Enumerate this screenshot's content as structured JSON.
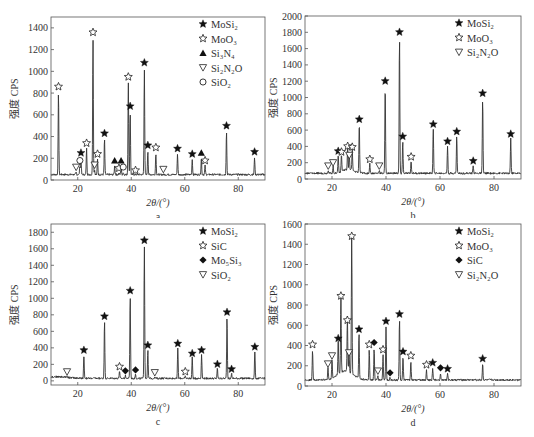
{
  "chart_data": [
    {
      "id": "a",
      "type": "line",
      "caption": "a",
      "xlabel": "2θ/(°)",
      "ylabel": "强度 CPS",
      "xlim": [
        10,
        90
      ],
      "ylim": [
        0,
        1500
      ],
      "xticks": [
        20,
        40,
        60,
        80
      ],
      "yticks": [
        0,
        200,
        400,
        600,
        800,
        1000,
        1200,
        1400
      ],
      "baseline": 50,
      "legend": [
        {
          "symbol": "star-filled",
          "label": "MoSi₂"
        },
        {
          "symbol": "star-open",
          "label": "MoO₃"
        },
        {
          "symbol": "triangle-up-filled",
          "label": "Si₃N₄"
        },
        {
          "symbol": "triangle-down-open",
          "label": "Si₂N₂O"
        },
        {
          "symbol": "circle-open",
          "label": "SiO₂"
        }
      ],
      "peaks": [
        {
          "x": 12.8,
          "y": 850,
          "phase": "MoO₃",
          "symbol": "star-open"
        },
        {
          "x": 19.4,
          "y": 110,
          "phase": "Si₂N₂O",
          "symbol": "triangle-down-open"
        },
        {
          "x": 20.8,
          "y": 170,
          "phase": "SiO₂",
          "symbol": "circle-open"
        },
        {
          "x": 21.2,
          "y": 240,
          "phase": "MoSi₂",
          "symbol": "star-filled"
        },
        {
          "x": 23.3,
          "y": 330,
          "phase": "MoO₃",
          "symbol": "star-open"
        },
        {
          "x": 25.7,
          "y": 1350,
          "phase": "MoO₃",
          "symbol": "star-open"
        },
        {
          "x": 26.3,
          "y": 130,
          "phase": "Si₂N₂O",
          "symbol": "triangle-down-open"
        },
        {
          "x": 27.4,
          "y": 230,
          "phase": "MoO₃",
          "symbol": "star-open"
        },
        {
          "x": 30.0,
          "y": 420,
          "phase": "MoSi₂",
          "symbol": "star-filled"
        },
        {
          "x": 33.8,
          "y": 170,
          "phase": "Si₃N₄",
          "symbol": "triangle-up-filled"
        },
        {
          "x": 35.4,
          "y": 100,
          "phase": "MoO₃",
          "symbol": "star-open"
        },
        {
          "x": 36.2,
          "y": 170,
          "phase": "Si₃N₄",
          "symbol": "triangle-up-filled"
        },
        {
          "x": 37.0,
          "y": 110,
          "phase": "SiO₂",
          "symbol": "circle-open"
        },
        {
          "x": 38.9,
          "y": 940,
          "phase": "MoO₃",
          "symbol": "star-open"
        },
        {
          "x": 39.6,
          "y": 670,
          "phase": "MoSi₂",
          "symbol": "star-filled"
        },
        {
          "x": 41.6,
          "y": 80,
          "phase": "MoO₃",
          "symbol": "star-open"
        },
        {
          "x": 44.9,
          "y": 1070,
          "phase": "MoSi₂",
          "symbol": "star-filled"
        },
        {
          "x": 46.2,
          "y": 310,
          "phase": "MoSi₂",
          "symbol": "star-filled"
        },
        {
          "x": 49.2,
          "y": 290,
          "phase": "MoO₃",
          "symbol": "star-open"
        },
        {
          "x": 52.0,
          "y": 90,
          "phase": "Si₂N₂O",
          "symbol": "triangle-down-open"
        },
        {
          "x": 57.3,
          "y": 280,
          "phase": "MoSi₂",
          "symbol": "star-filled"
        },
        {
          "x": 62.8,
          "y": 230,
          "phase": "MoSi₂",
          "symbol": "star-filled"
        },
        {
          "x": 66.2,
          "y": 240,
          "phase": "Si₃N₄",
          "symbol": "triangle-up-filled"
        },
        {
          "x": 67.6,
          "y": 170,
          "phase": "MoO₃",
          "symbol": "star-open"
        },
        {
          "x": 75.6,
          "y": 490,
          "phase": "MoSi₂",
          "symbol": "star-filled"
        },
        {
          "x": 86.1,
          "y": 250,
          "phase": "MoSi₂",
          "symbol": "star-filled"
        }
      ]
    },
    {
      "id": "b",
      "type": "line",
      "caption": "b",
      "xlabel": "2θ/(°)",
      "ylabel": "强度 CPS",
      "xlim": [
        10,
        90
      ],
      "ylim": [
        0,
        2000
      ],
      "xticks": [
        20,
        40,
        60,
        80
      ],
      "yticks": [
        0,
        200,
        400,
        600,
        800,
        1000,
        1200,
        1400,
        1600,
        1800,
        2000
      ],
      "baseline": 70,
      "legend": [
        {
          "symbol": "star-filled",
          "label": "MoSi₂"
        },
        {
          "symbol": "star-open",
          "label": "MoO₃"
        },
        {
          "symbol": "triangle-down-open",
          "label": "Si₂N₂O"
        }
      ],
      "peaks": [
        {
          "x": 18.6,
          "y": 150,
          "phase": "Si₂N₂O",
          "symbol": "triangle-down-open"
        },
        {
          "x": 20.4,
          "y": 190,
          "phase": "Si₂N₂O",
          "symbol": "triangle-down-open"
        },
        {
          "x": 22.3,
          "y": 330,
          "phase": "MoSi₂",
          "symbol": "star-filled"
        },
        {
          "x": 23.5,
          "y": 320,
          "phase": "MoO₃",
          "symbol": "star-open"
        },
        {
          "x": 25.8,
          "y": 390,
          "phase": "MoO₃",
          "symbol": "star-open"
        },
        {
          "x": 26.4,
          "y": 280,
          "phase": "Si₂N₂O",
          "symbol": "triangle-down-open"
        },
        {
          "x": 27.5,
          "y": 380,
          "phase": "MoO₃",
          "symbol": "star-open"
        },
        {
          "x": 30.1,
          "y": 720,
          "phase": "MoSi₂",
          "symbol": "star-filled"
        },
        {
          "x": 34.0,
          "y": 230,
          "phase": "MoO₃",
          "symbol": "star-open"
        },
        {
          "x": 37.5,
          "y": 150,
          "phase": "Si₂N₂O",
          "symbol": "triangle-down-open"
        },
        {
          "x": 39.7,
          "y": 1190,
          "phase": "MoSi₂",
          "symbol": "star-filled"
        },
        {
          "x": 45.0,
          "y": 1790,
          "phase": "MoSi₂",
          "symbol": "star-filled"
        },
        {
          "x": 46.2,
          "y": 510,
          "phase": "MoSi₂",
          "symbol": "star-filled"
        },
        {
          "x": 49.3,
          "y": 260,
          "phase": "MoO₃",
          "symbol": "star-open"
        },
        {
          "x": 57.5,
          "y": 660,
          "phase": "MoSi₂",
          "symbol": "star-filled"
        },
        {
          "x": 62.8,
          "y": 450,
          "phase": "MoSi₂",
          "symbol": "star-filled"
        },
        {
          "x": 66.2,
          "y": 570,
          "phase": "MoSi₂",
          "symbol": "star-filled"
        },
        {
          "x": 72.3,
          "y": 210,
          "phase": "MoSi₂",
          "symbol": "star-filled"
        },
        {
          "x": 75.8,
          "y": 1040,
          "phase": "MoSi₂",
          "symbol": "star-filled"
        },
        {
          "x": 86.2,
          "y": 540,
          "phase": "MoSi₂",
          "symbol": "star-filled"
        }
      ]
    },
    {
      "id": "c",
      "type": "line",
      "caption": "c",
      "xlabel": "2θ/(°)",
      "ylabel": "强度 CPS",
      "xlim": [
        10,
        90
      ],
      "ylim": [
        -50,
        1900
      ],
      "xticks": [
        20,
        40,
        60,
        80
      ],
      "yticks": [
        0,
        200,
        400,
        600,
        800,
        1000,
        1200,
        1400,
        1600,
        1800
      ],
      "baseline": 30,
      "legend": [
        {
          "symbol": "star-filled",
          "label": "MoSi₂"
        },
        {
          "symbol": "star-open",
          "label": "SiC"
        },
        {
          "symbol": "diamond-filled",
          "label": "Mo₅Si₃"
        },
        {
          "symbol": "triangle-down-open",
          "label": "SiO₂"
        }
      ],
      "peaks": [
        {
          "x": 16.0,
          "y": 100,
          "phase": "SiO₂",
          "symbol": "triangle-down-open"
        },
        {
          "x": 22.3,
          "y": 360,
          "phase": "MoSi₂",
          "symbol": "star-filled"
        },
        {
          "x": 30.0,
          "y": 770,
          "phase": "MoSi₂",
          "symbol": "star-filled"
        },
        {
          "x": 35.6,
          "y": 160,
          "phase": "SiC",
          "symbol": "star-open"
        },
        {
          "x": 37.8,
          "y": 110,
          "phase": "Mo₅Si₃",
          "symbol": "diamond-filled"
        },
        {
          "x": 41.6,
          "y": 120,
          "phase": "Mo₅Si₃",
          "symbol": "diamond-filled"
        },
        {
          "x": 39.6,
          "y": 1080,
          "phase": "MoSi₂",
          "symbol": "star-filled"
        },
        {
          "x": 44.9,
          "y": 1690,
          "phase": "MoSi₂",
          "symbol": "star-filled"
        },
        {
          "x": 46.2,
          "y": 420,
          "phase": "MoSi₂",
          "symbol": "star-filled"
        },
        {
          "x": 48.8,
          "y": 90,
          "phase": "SiO₂",
          "symbol": "triangle-down-open"
        },
        {
          "x": 57.4,
          "y": 440,
          "phase": "MoSi₂",
          "symbol": "star-filled"
        },
        {
          "x": 60.2,
          "y": 100,
          "phase": "SiC",
          "symbol": "star-open"
        },
        {
          "x": 62.8,
          "y": 320,
          "phase": "MoSi₂",
          "symbol": "star-filled"
        },
        {
          "x": 66.3,
          "y": 360,
          "phase": "MoSi₂",
          "symbol": "star-filled"
        },
        {
          "x": 72.2,
          "y": 190,
          "phase": "MoSi₂",
          "symbol": "star-filled"
        },
        {
          "x": 75.8,
          "y": 820,
          "phase": "MoSi₂",
          "symbol": "star-filled"
        },
        {
          "x": 77.5,
          "y": 130,
          "phase": "MoSi₂",
          "symbol": "star-filled"
        },
        {
          "x": 86.2,
          "y": 400,
          "phase": "MoSi₂",
          "symbol": "star-filled"
        }
      ]
    },
    {
      "id": "d",
      "type": "line",
      "caption": "d",
      "xlabel": "2θ/(°)",
      "ylabel": "强度 CPS",
      "xlim": [
        10,
        90
      ],
      "ylim": [
        0,
        1600
      ],
      "xticks": [
        20,
        40,
        60,
        80
      ],
      "yticks": [
        0,
        200,
        400,
        600,
        800,
        1000,
        1200,
        1400,
        1600
      ],
      "baseline": 60,
      "legend": [
        {
          "symbol": "star-filled",
          "label": "MoSi₂"
        },
        {
          "symbol": "star-open",
          "label": "MoO₃"
        },
        {
          "symbol": "diamond-filled",
          "label": "SiC"
        },
        {
          "symbol": "triangle-down-open",
          "label": "Si₂N₂O"
        }
      ],
      "peaks": [
        {
          "x": 12.8,
          "y": 400,
          "phase": "MoO₃",
          "symbol": "star-open"
        },
        {
          "x": 18.5,
          "y": 210,
          "phase": "Si₂N₂O",
          "symbol": "triangle-down-open"
        },
        {
          "x": 20.0,
          "y": 290,
          "phase": "Si₂N₂O",
          "symbol": "triangle-down-open"
        },
        {
          "x": 22.3,
          "y": 460,
          "phase": "MoSi₂",
          "symbol": "star-filled"
        },
        {
          "x": 23.3,
          "y": 880,
          "phase": "MoO₃",
          "symbol": "star-open"
        },
        {
          "x": 25.7,
          "y": 640,
          "phase": "MoO₃",
          "symbol": "star-open"
        },
        {
          "x": 26.3,
          "y": 320,
          "phase": "Si₂N₂O",
          "symbol": "triangle-down-open"
        },
        {
          "x": 27.3,
          "y": 1470,
          "phase": "MoO₃",
          "symbol": "star-open"
        },
        {
          "x": 30.0,
          "y": 550,
          "phase": "MoSi₂",
          "symbol": "star-filled"
        },
        {
          "x": 33.8,
          "y": 400,
          "phase": "MoO₃",
          "symbol": "star-open"
        },
        {
          "x": 35.6,
          "y": 420,
          "phase": "SiC",
          "symbol": "diamond-filled"
        },
        {
          "x": 37.0,
          "y": 140,
          "phase": "Si₂N₂O",
          "symbol": "triangle-down-open"
        },
        {
          "x": 38.9,
          "y": 350,
          "phase": "MoO₃",
          "symbol": "star-open"
        },
        {
          "x": 40.0,
          "y": 630,
          "phase": "MoSi₂",
          "symbol": "star-filled"
        },
        {
          "x": 41.5,
          "y": 120,
          "phase": "SiC",
          "symbol": "diamond-filled"
        },
        {
          "x": 45.0,
          "y": 700,
          "phase": "MoSi₂",
          "symbol": "star-filled"
        },
        {
          "x": 46.3,
          "y": 330,
          "phase": "MoSi₂",
          "symbol": "star-filled"
        },
        {
          "x": 49.2,
          "y": 290,
          "phase": "MoO₃",
          "symbol": "star-open"
        },
        {
          "x": 55.0,
          "y": 200,
          "phase": "MoO₃",
          "symbol": "star-open"
        },
        {
          "x": 57.3,
          "y": 220,
          "phase": "MoSi₂",
          "symbol": "star-filled"
        },
        {
          "x": 60.2,
          "y": 170,
          "phase": "SiC",
          "symbol": "diamond-filled"
        },
        {
          "x": 62.8,
          "y": 160,
          "phase": "MoSi₂",
          "symbol": "star-filled"
        },
        {
          "x": 75.8,
          "y": 260,
          "phase": "MoSi₂",
          "symbol": "star-filled"
        }
      ]
    }
  ],
  "panels": [
    {
      "caption": "a",
      "xlabel": "2θ/(°)",
      "ylabel": "强度 CPS"
    },
    {
      "caption": "b",
      "xlabel": "2θ/(°)",
      "ylabel": "强度 CPS"
    },
    {
      "caption": "c",
      "xlabel": "2θ/(°)",
      "ylabel": "强度 CPS"
    },
    {
      "caption": "d",
      "xlabel": "2θ/(°)",
      "ylabel": "强度 CPS"
    }
  ]
}
